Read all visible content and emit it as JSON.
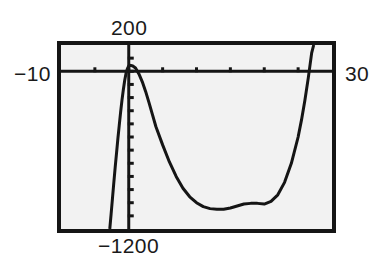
{
  "screen": {
    "title": "graphing-calculator-plot",
    "background_color": "#ffffff",
    "plot_background_color": "#f2f2f2",
    "frame_color": "#151515",
    "curve_color": "#151515"
  },
  "labels": {
    "y_max": "200",
    "y_min": "−1200",
    "x_min": "−10",
    "x_max": "30"
  },
  "chart_data": {
    "type": "line",
    "title": "",
    "xlabel": "",
    "ylabel": "",
    "xlim": [
      -10,
      30
    ],
    "ylim": [
      -1200,
      200
    ],
    "grid": false,
    "legend": "none",
    "axes": {
      "x_axis_visible": true,
      "y_axis_visible": true,
      "x_tick_interval": 5,
      "y_tick_interval": 100,
      "x_ticks": [
        -10,
        -5,
        0,
        5,
        10,
        15,
        20,
        25,
        30
      ],
      "y_ticks": [
        200,
        100,
        0,
        -100,
        -200,
        -300,
        -400,
        -500,
        -600,
        -700,
        -800,
        -900,
        -1000,
        -1100,
        -1200
      ]
    },
    "annotations": [
      "local maximum just above x-axis near x = 0",
      "local minimum near x = 20, y ≈ -1010",
      "curve exits top of window near x = 27"
    ],
    "series": [
      {
        "name": "y1",
        "x": [
          -2.8,
          -2.6,
          -2.4,
          -2.2,
          -2.0,
          -1.8,
          -1.6,
          -1.4,
          -1.2,
          -1.0,
          -0.8,
          -0.6,
          -0.4,
          -0.2,
          0.0,
          0.3,
          0.6,
          1.0,
          1.5,
          2.0,
          2.5,
          3.0,
          3.5,
          4.0,
          5.0,
          6.0,
          7.0,
          8.0,
          9.0,
          10.0,
          11.0,
          12.0,
          13.0,
          14.0,
          15.0,
          16.0,
          17.0,
          18.0,
          19.0,
          20.0,
          21.0,
          22.0,
          23.0,
          24.0,
          25.0,
          25.5,
          26.0,
          26.5,
          27.0,
          27.3
        ],
        "y": [
          -1200,
          -1085,
          -965,
          -845,
          -730,
          -620,
          -510,
          -410,
          -310,
          -220,
          -140,
          -70,
          -15,
          20,
          40,
          45,
          40,
          25,
          -20,
          -80,
          -155,
          -240,
          -330,
          -420,
          -560,
          -690,
          -800,
          -890,
          -955,
          -1000,
          -1030,
          -1045,
          -1050,
          -1050,
          -1040,
          -1025,
          -1010,
          -1005,
          -1005,
          -1010,
          -990,
          -940,
          -845,
          -700,
          -500,
          -370,
          -220,
          -50,
          140,
          200
        ]
      }
    ]
  }
}
